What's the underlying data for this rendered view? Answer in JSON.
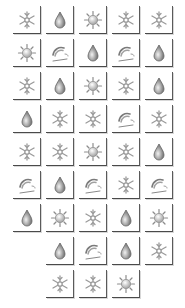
{
  "board": {
    "columns": 5,
    "origin": {
      "x": 13,
      "y": 6
    },
    "pitch": {
      "x": 33,
      "y": 33
    },
    "colors": {
      "tile_bg": "#ffffff",
      "tile_border": "#4a4a4a",
      "snow": "#9a9a9a",
      "sun": "#8c8c8c",
      "rain": "#6e6e6e",
      "wind": "#7a7a7a"
    },
    "rows": [
      [
        "snow-icon",
        "rain-icon",
        "sun-icon",
        "snow-icon",
        "snow-icon"
      ],
      [
        "sun-icon",
        "wind-icon",
        "rain-icon",
        "wind-icon",
        "rain-icon"
      ],
      [
        "snow-icon",
        "rain-icon",
        "sun-icon",
        "snow-icon",
        "rain-icon"
      ],
      [
        "rain-icon",
        "snow-icon",
        "snow-icon",
        "wind-icon",
        "snow-icon"
      ],
      [
        "snow-icon",
        "snow-icon",
        "sun-icon",
        "snow-icon",
        "rain-icon"
      ],
      [
        "wind-icon",
        "rain-icon",
        "wind-icon",
        "snow-icon",
        "wind-icon"
      ],
      [
        "rain-icon",
        "sun-icon",
        "snow-icon",
        "rain-icon",
        "sun-icon"
      ],
      [
        null,
        "rain-icon",
        "wind-icon",
        "rain-icon",
        "snow-icon"
      ],
      [
        null,
        "snow-icon",
        "snow-icon",
        "sun-icon",
        null
      ]
    ]
  }
}
